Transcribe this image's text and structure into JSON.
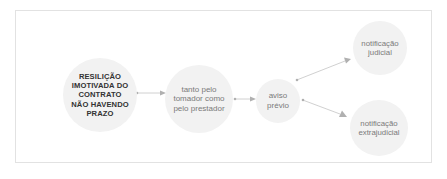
{
  "diagram": {
    "nodes": [
      {
        "id": "main",
        "label": "RESILIÇÃO IMOTIVADA DO CONTRATO NÃO HAVENDO PRAZO",
        "lines": [
          "RESILIÇÃO",
          "IMOTIVADA DO",
          "CONTRATO",
          "NÃO HAVENDO",
          "PRAZO"
        ]
      },
      {
        "id": "parties",
        "label": "tanto pelo tomador como pelo prestador",
        "lines": [
          "tanto pelo",
          "tomador como",
          "pelo prestador"
        ]
      },
      {
        "id": "notice",
        "label": "aviso prévio",
        "lines": [
          "aviso",
          "prévio"
        ]
      },
      {
        "id": "judicial",
        "label": "notificação judicial",
        "lines": [
          "notificação",
          "judicial"
        ]
      },
      {
        "id": "extrajudicial",
        "label": "notificação extrajudicial",
        "lines": [
          "notificação",
          "extrajudicial"
        ]
      }
    ],
    "edges": [
      {
        "from": "main",
        "to": "parties"
      },
      {
        "from": "parties",
        "to": "notice"
      },
      {
        "from": "notice",
        "to": "judicial"
      },
      {
        "from": "notice",
        "to": "extrajudicial"
      }
    ],
    "colors": {
      "node_fill": "#f2f2f2",
      "main_text": "#333333",
      "text": "#7a7a7a",
      "arrow": "#b0b0b0",
      "frame_border": "#e2e2e2"
    }
  }
}
